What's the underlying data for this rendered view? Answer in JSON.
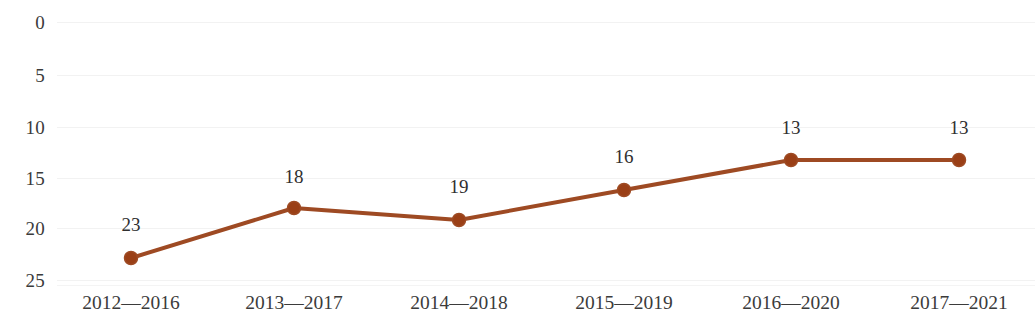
{
  "chart_data": {
    "type": "line",
    "title": "",
    "subtitle": "",
    "xlabel": "",
    "ylabel": "",
    "categories": [
      "2012—2016",
      "2013—2017",
      "2014—2018",
      "2015—2019",
      "2016—2020",
      "2017—2021"
    ],
    "values": [
      23,
      18,
      19,
      16,
      13,
      13
    ],
    "data_labels": [
      "23",
      "18",
      "19",
      "16",
      "13",
      "13"
    ],
    "y_ticks": [
      "0",
      "5",
      "10",
      "15",
      "20",
      "25"
    ],
    "y_tick_values": [
      0,
      5,
      10,
      15,
      20,
      25
    ],
    "ylim": [
      0,
      25
    ],
    "y_axis_inverted": true,
    "grid": true,
    "legend": false,
    "legend_position": "none",
    "series": [
      {
        "name": "",
        "values": [
          23,
          18,
          19,
          16,
          13,
          13
        ]
      }
    ],
    "colors": {
      "line": "#9e4a23",
      "marker_fill": "#9a3f16",
      "marker_edge": "#c1seven",
      "grid": "#f2f2f2",
      "text": "#3b3b3b",
      "background": "#ffffff"
    }
  },
  "geometry": {
    "point_x": [
      131,
      294,
      459,
      624,
      791,
      959
    ],
    "point_y": [
      258,
      208,
      220,
      190,
      160,
      160
    ],
    "label_x": [
      131,
      294,
      459,
      624,
      791,
      959
    ],
    "label_y": [
      224,
      176,
      186,
      156,
      127,
      127
    ],
    "y_tick_y": [
      22,
      75,
      127,
      178,
      228,
      280
    ],
    "x_tick_x": [
      131,
      294,
      459,
      624,
      791,
      959
    ]
  }
}
